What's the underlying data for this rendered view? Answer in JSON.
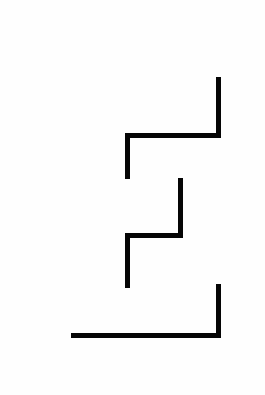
{
  "canvas": {
    "width": 265,
    "height": 395,
    "background_color": "#fefefe",
    "title": "abstract-line-drawing"
  },
  "drawing": {
    "stroke_color": "#050505",
    "stroke_width": 5,
    "stroke_linecap": "butt",
    "stroke_linejoin": "miter",
    "shape_count": 3,
    "shapes": [
      {
        "name": "upper-zigzag-stroke",
        "description": "vertical down from top-right, left along horizontal, then down",
        "points": "M 218.5 77 L 218.5 135 L 127.5 135 L 127.5 179",
        "vertices": [
          [
            218.5,
            77
          ],
          [
            218.5,
            135
          ],
          [
            127.5,
            135
          ],
          [
            127.5,
            179
          ]
        ]
      },
      {
        "name": "middle-zigzag-stroke",
        "description": "vertical down from middle, left along horizontal, then down",
        "points": "M 180.5 178 L 180.5 235 L 127.5 235 L 127.5 288",
        "vertices": [
          [
            180.5,
            178
          ],
          [
            180.5,
            235
          ],
          [
            127.5,
            235
          ],
          [
            127.5,
            288
          ]
        ]
      },
      {
        "name": "lower-corner-stroke",
        "description": "vertical down from lower-right then left along bottom horizontal",
        "points": "M 218.5 284 L 218.5 335.5 L 71 335.5",
        "vertices": [
          [
            218.5,
            284
          ],
          [
            218.5,
            335.5
          ],
          [
            71,
            335.5
          ]
        ]
      }
    ]
  }
}
